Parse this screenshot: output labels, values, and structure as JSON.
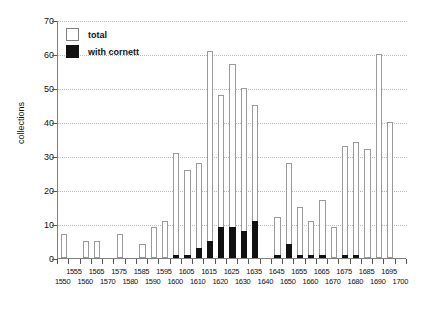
{
  "chart_data": {
    "type": "bar",
    "title": "",
    "xlabel": "",
    "ylabel": "collections",
    "ylim": [
      0,
      70
    ],
    "yticks": [
      0,
      10,
      20,
      30,
      40,
      50,
      60,
      70
    ],
    "grid": true,
    "legend_position": "top-left",
    "categories": [
      "1550",
      "1555",
      "1560",
      "1565",
      "1570",
      "1575",
      "1580",
      "1585",
      "1590",
      "1595",
      "1600",
      "1605",
      "1610",
      "1615",
      "1620",
      "1625",
      "1630",
      "1635",
      "1640",
      "1645",
      "1650",
      "1655",
      "1660",
      "1665",
      "1670",
      "1675",
      "1680",
      "1685",
      "1690",
      "1695",
      "1700"
    ],
    "xtick_labels_top": [
      "1555",
      "1565",
      "1575",
      "1585",
      "1595",
      "1605",
      "1615",
      "1625",
      "1635",
      "1645",
      "1655",
      "1665",
      "1675",
      "1685",
      "1695"
    ],
    "xtick_labels_bottom": [
      "1550",
      "1560",
      "1570",
      "1580",
      "1590",
      "1600",
      "1610",
      "1620",
      "1630",
      "1640",
      "1650",
      "1660",
      "1670",
      "1680",
      "1690",
      "1700"
    ],
    "series": [
      {
        "name": "total",
        "color": "#ffffff",
        "edge_color": "#9a9a9a",
        "values": [
          7,
          0,
          5,
          5,
          0,
          7,
          0,
          4,
          9,
          11,
          31,
          26,
          28,
          61,
          48,
          57,
          50,
          45,
          0,
          12,
          28,
          15,
          11,
          17,
          9,
          33,
          34,
          32,
          60,
          40,
          0
        ]
      },
      {
        "name": "with cornett",
        "color": "#111111",
        "values": [
          0,
          0,
          0,
          0,
          0,
          0,
          0,
          0,
          0,
          0,
          1,
          1,
          3,
          5,
          9,
          9,
          8,
          11,
          0,
          1,
          4,
          1,
          1,
          1,
          0,
          1,
          1,
          0,
          0,
          0,
          0
        ]
      }
    ]
  }
}
